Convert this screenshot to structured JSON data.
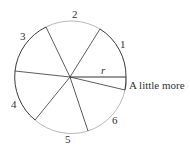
{
  "diagram": {
    "center": [
      70,
      77
    ],
    "radius": 56,
    "colors": {
      "dark_arc": "#3a3a3a",
      "light_arc": "#b8b8b8",
      "radius_line": "#333333",
      "text": "#333333"
    },
    "radius_label": "r",
    "arc_labels": [
      {
        "label": "1",
        "x": 120,
        "y": 48
      },
      {
        "label": "2",
        "x": 72,
        "y": 18
      },
      {
        "label": "3",
        "x": 20,
        "y": 40
      },
      {
        "label": "4",
        "x": 11,
        "y": 108
      },
      {
        "label": "5",
        "x": 65,
        "y": 143
      },
      {
        "label": "6",
        "x": 112,
        "y": 124
      }
    ],
    "remainder_label": "A little more"
  }
}
